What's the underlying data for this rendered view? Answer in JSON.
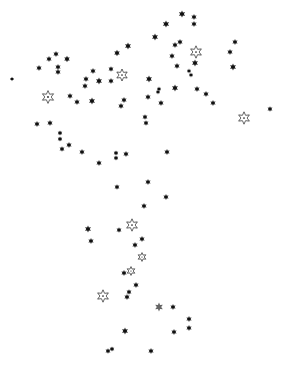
{
  "canvas": {
    "width": 284,
    "height": 373,
    "background": "#ffffff"
  },
  "colors": {
    "star_fill": "#111111",
    "hollow_stroke": "#222222",
    "grey_star": "#333333"
  },
  "star_types": {
    "solid": "small-filled-six-point-star",
    "hollow": "large-outlined-six-point-star-with-center-dot"
  },
  "stars": [
    {
      "x": 182,
      "y": 14,
      "type": "solid",
      "size": 3.6
    },
    {
      "x": 194,
      "y": 17,
      "type": "solid",
      "size": 3.0
    },
    {
      "x": 194,
      "y": 24,
      "type": "solid",
      "size": 3.0
    },
    {
      "x": 166,
      "y": 24,
      "type": "solid",
      "size": 3.6
    },
    {
      "x": 155,
      "y": 37,
      "type": "solid",
      "size": 3.4
    },
    {
      "x": 128,
      "y": 46,
      "type": "solid",
      "size": 3.4
    },
    {
      "x": 117,
      "y": 53,
      "type": "solid",
      "size": 3.2
    },
    {
      "x": 180,
      "y": 42,
      "type": "solid",
      "size": 3.0
    },
    {
      "x": 175,
      "y": 45,
      "type": "solid",
      "size": 3.0
    },
    {
      "x": 196,
      "y": 52,
      "type": "hollow",
      "size": 6.2
    },
    {
      "x": 172,
      "y": 56,
      "type": "solid",
      "size": 3.0
    },
    {
      "x": 195,
      "y": 63,
      "type": "solid",
      "size": 3.4
    },
    {
      "x": 177,
      "y": 66,
      "type": "solid",
      "size": 3.0
    },
    {
      "x": 189,
      "y": 71,
      "type": "solid",
      "size": 2.4
    },
    {
      "x": 191,
      "y": 75,
      "type": "solid",
      "size": 2.4
    },
    {
      "x": 235,
      "y": 42,
      "type": "solid",
      "size": 3.0
    },
    {
      "x": 230,
      "y": 52,
      "type": "solid",
      "size": 3.0
    },
    {
      "x": 233,
      "y": 67,
      "type": "solid",
      "size": 3.4
    },
    {
      "x": 12,
      "y": 79,
      "type": "solid",
      "size": 2.2
    },
    {
      "x": 39,
      "y": 68,
      "type": "solid",
      "size": 3.0
    },
    {
      "x": 49,
      "y": 59,
      "type": "solid",
      "size": 3.0
    },
    {
      "x": 56,
      "y": 54,
      "type": "solid",
      "size": 3.0
    },
    {
      "x": 67,
      "y": 59,
      "type": "solid",
      "size": 3.2
    },
    {
      "x": 58,
      "y": 67,
      "type": "solid",
      "size": 3.0
    },
    {
      "x": 58,
      "y": 72,
      "type": "solid",
      "size": 3.0
    },
    {
      "x": 48,
      "y": 97,
      "type": "hollow",
      "size": 6.4
    },
    {
      "x": 70,
      "y": 96,
      "type": "solid",
      "size": 3.0
    },
    {
      "x": 77,
      "y": 102,
      "type": "solid",
      "size": 3.0
    },
    {
      "x": 92,
      "y": 101,
      "type": "solid",
      "size": 3.4
    },
    {
      "x": 93,
      "y": 71,
      "type": "solid",
      "size": 3.0
    },
    {
      "x": 86,
      "y": 79,
      "type": "solid",
      "size": 3.0
    },
    {
      "x": 85,
      "y": 86,
      "type": "solid",
      "size": 3.0
    },
    {
      "x": 99,
      "y": 81,
      "type": "solid",
      "size": 3.4
    },
    {
      "x": 111,
      "y": 69,
      "type": "solid",
      "size": 2.8
    },
    {
      "x": 111,
      "y": 81,
      "type": "solid",
      "size": 3.0
    },
    {
      "x": 122,
      "y": 75,
      "type": "hollow",
      "size": 6.0
    },
    {
      "x": 124,
      "y": 100,
      "type": "solid",
      "size": 3.0
    },
    {
      "x": 121,
      "y": 106,
      "type": "solid",
      "size": 3.0
    },
    {
      "x": 149,
      "y": 79,
      "type": "solid",
      "size": 3.4
    },
    {
      "x": 159,
      "y": 89,
      "type": "solid",
      "size": 2.4
    },
    {
      "x": 158,
      "y": 92,
      "type": "solid",
      "size": 2.4
    },
    {
      "x": 175,
      "y": 88,
      "type": "solid",
      "size": 3.4
    },
    {
      "x": 197,
      "y": 89,
      "type": "solid",
      "size": 3.0
    },
    {
      "x": 206,
      "y": 94,
      "type": "solid",
      "size": 3.0
    },
    {
      "x": 213,
      "y": 103,
      "type": "solid",
      "size": 3.0
    },
    {
      "x": 148,
      "y": 97,
      "type": "solid",
      "size": 3.0
    },
    {
      "x": 161,
      "y": 103,
      "type": "solid",
      "size": 3.0
    },
    {
      "x": 145,
      "y": 117,
      "type": "solid",
      "size": 2.8
    },
    {
      "x": 146,
      "y": 123,
      "type": "solid",
      "size": 2.8
    },
    {
      "x": 244,
      "y": 118,
      "type": "hollow",
      "size": 6.2
    },
    {
      "x": 270,
      "y": 109,
      "type": "solid",
      "size": 2.8
    },
    {
      "x": 37,
      "y": 124,
      "type": "solid",
      "size": 3.0
    },
    {
      "x": 50,
      "y": 123,
      "type": "solid",
      "size": 3.0
    },
    {
      "x": 60,
      "y": 133,
      "type": "solid",
      "size": 2.6
    },
    {
      "x": 60,
      "y": 139,
      "type": "solid",
      "size": 2.6
    },
    {
      "x": 62,
      "y": 149,
      "type": "solid",
      "size": 2.8
    },
    {
      "x": 69,
      "y": 145,
      "type": "solid",
      "size": 3.0
    },
    {
      "x": 82,
      "y": 152,
      "type": "solid",
      "size": 3.0
    },
    {
      "x": 99,
      "y": 163,
      "type": "solid",
      "size": 3.0
    },
    {
      "x": 116,
      "y": 153,
      "type": "solid",
      "size": 2.6
    },
    {
      "x": 116,
      "y": 158,
      "type": "solid",
      "size": 2.6
    },
    {
      "x": 126,
      "y": 154,
      "type": "solid",
      "size": 3.0
    },
    {
      "x": 167,
      "y": 152,
      "type": "solid",
      "size": 3.0
    },
    {
      "x": 117,
      "y": 187,
      "type": "solid",
      "size": 2.8
    },
    {
      "x": 148,
      "y": 182,
      "type": "solid",
      "size": 3.0
    },
    {
      "x": 166,
      "y": 197,
      "type": "solid",
      "size": 3.0
    },
    {
      "x": 144,
      "y": 206,
      "type": "solid",
      "size": 3.0
    },
    {
      "x": 88,
      "y": 229,
      "type": "solid",
      "size": 3.4
    },
    {
      "x": 91,
      "y": 241,
      "type": "solid",
      "size": 3.0
    },
    {
      "x": 119,
      "y": 230,
      "type": "solid",
      "size": 2.8
    },
    {
      "x": 132,
      "y": 225,
      "type": "hollow",
      "size": 6.2
    },
    {
      "x": 142,
      "y": 239,
      "type": "solid",
      "size": 3.0
    },
    {
      "x": 135,
      "y": 245,
      "type": "solid",
      "size": 3.0
    },
    {
      "x": 142,
      "y": 257,
      "type": "hollow",
      "size": 4.4
    },
    {
      "x": 124,
      "y": 273,
      "type": "solid",
      "size": 3.0
    },
    {
      "x": 131,
      "y": 271,
      "type": "hollow",
      "size": 4.4
    },
    {
      "x": 136,
      "y": 285,
      "type": "solid",
      "size": 3.0
    },
    {
      "x": 129,
      "y": 292,
      "type": "solid",
      "size": 2.8
    },
    {
      "x": 127,
      "y": 297,
      "type": "solid",
      "size": 3.0
    },
    {
      "x": 103,
      "y": 296,
      "type": "hollow",
      "size": 6.2
    },
    {
      "x": 159,
      "y": 307,
      "type": "grey",
      "size": 4.4
    },
    {
      "x": 173,
      "y": 307,
      "type": "solid",
      "size": 3.0
    },
    {
      "x": 189,
      "y": 319,
      "type": "solid",
      "size": 3.0
    },
    {
      "x": 189,
      "y": 328,
      "type": "solid",
      "size": 3.0
    },
    {
      "x": 174,
      "y": 332,
      "type": "solid",
      "size": 3.0
    },
    {
      "x": 125,
      "y": 331,
      "type": "solid",
      "size": 3.4
    },
    {
      "x": 108,
      "y": 351,
      "type": "solid",
      "size": 2.8
    },
    {
      "x": 112,
      "y": 349,
      "type": "solid",
      "size": 2.6
    },
    {
      "x": 151,
      "y": 351,
      "type": "solid",
      "size": 3.0
    }
  ]
}
